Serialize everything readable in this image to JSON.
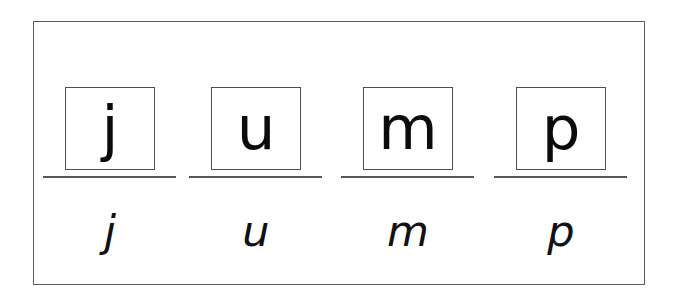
{
  "worksheet": {
    "word": "jump",
    "background_color": "#ffffff",
    "frame_color": "#5a5a5e",
    "ink_color": "#0b0b0d",
    "rule_color": "#57575c",
    "letters": [
      {
        "printed": "j",
        "script": "j"
      },
      {
        "printed": "u",
        "script": "u"
      },
      {
        "printed": "m",
        "script": "m"
      },
      {
        "printed": "p",
        "script": "p"
      }
    ]
  }
}
